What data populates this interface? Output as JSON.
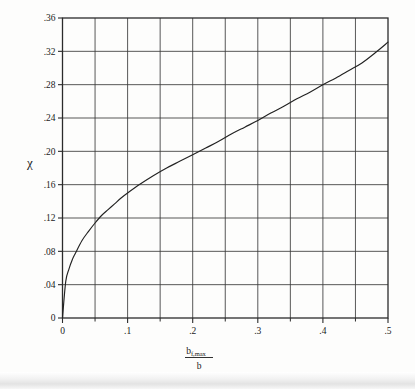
{
  "figure": {
    "name": "chi-vs-flap-span-ratio-chart",
    "background_color": "#fdfdfc",
    "line_color": "#222222",
    "grid_color": "#3a3a3a"
  },
  "chart_data": {
    "type": "line",
    "title": "",
    "subtitle": "",
    "xlabel": "b f,max / b",
    "xlabel_numerator": "b",
    "xlabel_numerator_sub": "f,max",
    "xlabel_denominator": "b",
    "ylabel": "χ",
    "xlim": [
      0,
      0.5
    ],
    "ylim": [
      0,
      0.36
    ],
    "grid": true,
    "legend_position": "none",
    "xticks": [
      0,
      0.1,
      0.2,
      0.3,
      0.4,
      0.5
    ],
    "xticklabels": [
      "0",
      ".1",
      ".2",
      ".3",
      ".4",
      ".5"
    ],
    "xminorticks": [
      0.05,
      0.15,
      0.25,
      0.35,
      0.45
    ],
    "yticks": [
      0,
      0.04,
      0.08,
      0.12,
      0.16,
      0.2,
      0.24,
      0.28,
      0.32,
      0.36
    ],
    "yticklabels": [
      "0",
      ".04",
      ".08",
      ".12",
      ".16",
      ".20",
      ".24",
      ".28",
      ".32",
      ".36"
    ],
    "series": [
      {
        "name": "chi",
        "x": [
          0.0,
          0.005,
          0.01,
          0.015,
          0.02,
          0.03,
          0.04,
          0.05,
          0.06,
          0.07,
          0.08,
          0.09,
          0.1,
          0.12,
          0.14,
          0.16,
          0.18,
          0.2,
          0.22,
          0.24,
          0.26,
          0.28,
          0.3,
          0.32,
          0.34,
          0.36,
          0.38,
          0.4,
          0.42,
          0.44,
          0.46,
          0.48,
          0.5
        ],
        "y": [
          0.0,
          0.044,
          0.059,
          0.07,
          0.078,
          0.093,
          0.104,
          0.114,
          0.123,
          0.13,
          0.137,
          0.144,
          0.15,
          0.161,
          0.171,
          0.18,
          0.188,
          0.196,
          0.204,
          0.212,
          0.221,
          0.229,
          0.237,
          0.246,
          0.254,
          0.263,
          0.271,
          0.28,
          0.288,
          0.297,
          0.306,
          0.318,
          0.331
        ]
      }
    ]
  }
}
